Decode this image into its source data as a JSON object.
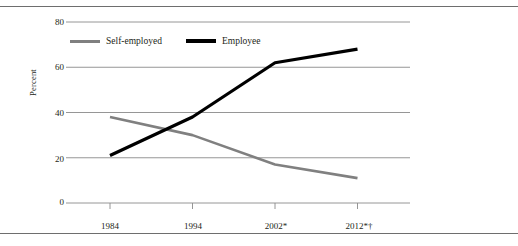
{
  "figure": {
    "ylabel": "Percent",
    "legend": [
      {
        "label": "Self-employed",
        "color": "#808080",
        "key": "self_employed"
      },
      {
        "label": "Employee",
        "color": "#000000",
        "key": "employee"
      }
    ]
  },
  "chart_data": {
    "type": "line",
    "title": "",
    "xlabel": "",
    "ylabel": "Percent",
    "categories": [
      "1984",
      "1994",
      "2002*",
      "2012*†"
    ],
    "x_tick_labels": [
      "1984",
      "1994",
      "2002*",
      "2012*†"
    ],
    "y_tick_labels": [
      "0",
      "20",
      "40",
      "60",
      "80"
    ],
    "y_ticks": [
      0,
      20,
      40,
      60,
      80
    ],
    "ylim": [
      0,
      80
    ],
    "grid": "horizontal",
    "legend_position": "upper-left-inside",
    "series": [
      {
        "name": "Self-employed",
        "color": "#808080",
        "values": [
          38,
          30,
          17,
          11
        ]
      },
      {
        "name": "Employee",
        "color": "#000000",
        "values": [
          21,
          38,
          62,
          68
        ]
      }
    ]
  }
}
